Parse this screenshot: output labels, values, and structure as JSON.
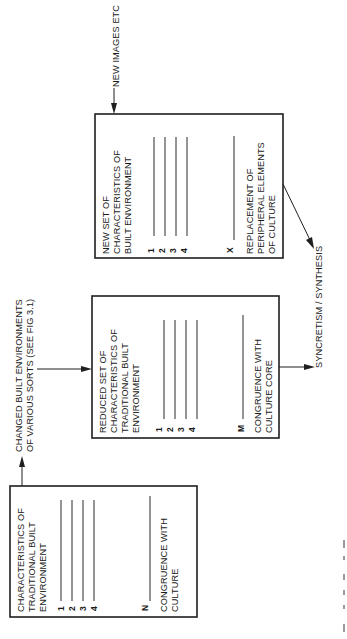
{
  "diagram": {
    "orientation": "rotated-90-ccw",
    "boxes": [
      {
        "id": "traditional",
        "title_lines": [
          "CHARACTERISTICS OF",
          "TRADITIONAL BUILT",
          "ENVIRONMENT"
        ],
        "items": [
          "1",
          "2",
          "3",
          "4"
        ],
        "extra_item": "N",
        "footer_lines": [
          "CONGRUENCE WITH",
          "CULTURE"
        ]
      },
      {
        "id": "reduced",
        "title_lines": [
          "REDUCED SET OF",
          "CHARACTERISTICS OF",
          "TRADITIONAL BUILT",
          "ENVIRONMENT"
        ],
        "items": [
          "1",
          "2",
          "3",
          "4"
        ],
        "extra_item": "M",
        "footer_lines": [
          "CONGRUENCE WITH",
          "CULTURE CORE"
        ]
      },
      {
        "id": "new",
        "title_lines": [
          "NEW SET OF",
          "CHARACTERISTICS OF",
          "BUILT ENVIRONMENT"
        ],
        "items": [
          "1",
          "2",
          "3",
          "4"
        ],
        "extra_item": "X",
        "footer_lines": [
          "REPLACEMENT OF",
          "PERIPHERAL ELEMENTS",
          "OF CULTURE"
        ]
      }
    ],
    "inputs": {
      "changed_env_lines": [
        "CHANGED BUILT ENVIRONMENTS",
        "OF VARIOUS SORTS (SEE FIG 3.1)"
      ],
      "new_images": "NEW IMAGES ETC"
    },
    "output": {
      "label": "SYNCRETISM / SYNTHESIS"
    }
  }
}
